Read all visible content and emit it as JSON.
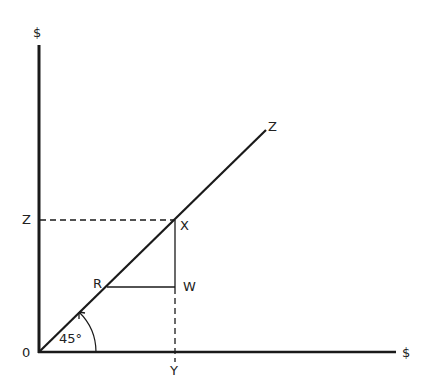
{
  "diagram": {
    "type": "45-degree line diagram",
    "axes": {
      "y_axis_label": "$",
      "x_axis_label": "$",
      "origin_label": "0"
    },
    "line_label": "Z",
    "angle_label": "45°",
    "points": {
      "X": "X",
      "R": "R",
      "W": "W",
      "Y": "Y",
      "Z_axis": "Z"
    },
    "colors": {
      "ink": "#1a1a1a",
      "background": "#ffffff"
    }
  }
}
